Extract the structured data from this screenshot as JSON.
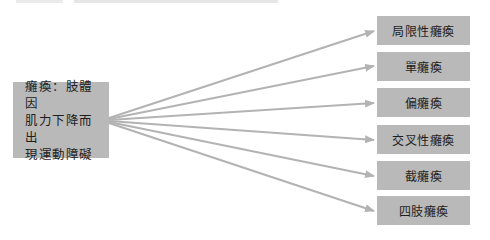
{
  "diagram": {
    "type": "one-to-many-classification",
    "source": {
      "label": "癱瘓：肢體因\n肌力下降而出\n現運動障礙"
    },
    "targets": [
      {
        "label": "局限性癱瘓"
      },
      {
        "label": "單癱瘓"
      },
      {
        "label": "偏癱瘓"
      },
      {
        "label": "交叉性癱瘓"
      },
      {
        "label": "截癱瘓"
      },
      {
        "label": "四肢癱瘓"
      }
    ],
    "colors": {
      "box_fill": "#b9b9b9",
      "arrow": "#b3b3b3",
      "text": "#1e1e1e"
    }
  }
}
